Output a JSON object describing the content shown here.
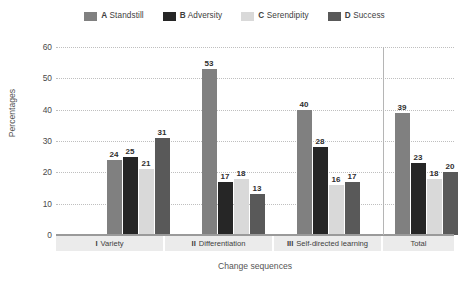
{
  "chart_data": {
    "type": "bar",
    "title": "",
    "xlabel": "Change sequences",
    "ylabel": "Percentages",
    "ylim": [
      0,
      60
    ],
    "yticks": [
      0,
      10,
      20,
      30,
      40,
      50,
      60
    ],
    "grid": true,
    "legend_position": "top-center",
    "categories": [
      "I Variety",
      "II Differentiation",
      "III Self-directed learning",
      "Total"
    ],
    "category_parts": [
      {
        "num": "I",
        "name": "Variety"
      },
      {
        "num": "II",
        "name": "Differentiation"
      },
      {
        "num": "III",
        "name": "Self-directed learning"
      },
      {
        "num": "",
        "name": "Total"
      }
    ],
    "series": [
      {
        "key": "A",
        "name": "Standstill",
        "color": "#808080",
        "values": [
          24,
          53,
          40,
          39
        ]
      },
      {
        "key": "B",
        "name": "Adversity",
        "color": "#262626",
        "values": [
          25,
          17,
          28,
          23
        ]
      },
      {
        "key": "C",
        "name": "Serendipity",
        "color": "#d9d9d9",
        "values": [
          21,
          18,
          16,
          18
        ]
      },
      {
        "key": "D",
        "name": "Success",
        "color": "#595959",
        "values": [
          31,
          13,
          17,
          20
        ]
      }
    ]
  }
}
